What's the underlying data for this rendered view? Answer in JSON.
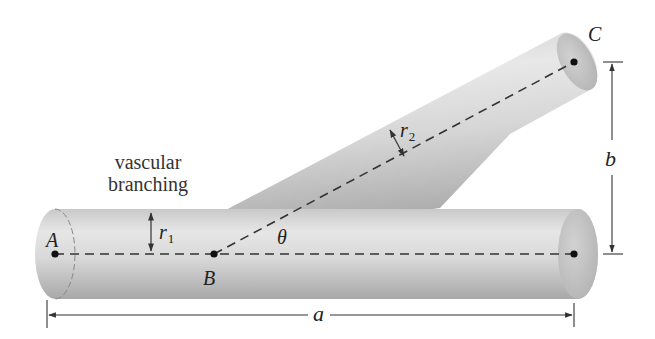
{
  "figure": {
    "title": "vascular branching",
    "caption_lines": [
      "vascular",
      "branching"
    ],
    "points": {
      "A": "A",
      "B": "B",
      "C": "C"
    },
    "labels": {
      "r1": "r",
      "r1_sub": "1",
      "r2": "r",
      "r2_sub": "2",
      "theta": "θ",
      "a": "a",
      "b": "b"
    },
    "colors": {
      "tube_light": "#e4e4e4",
      "tube_mid": "#cfcfcf",
      "tube_dark": "#a9a9a9",
      "line": "#333333",
      "background": "#ffffff"
    }
  }
}
